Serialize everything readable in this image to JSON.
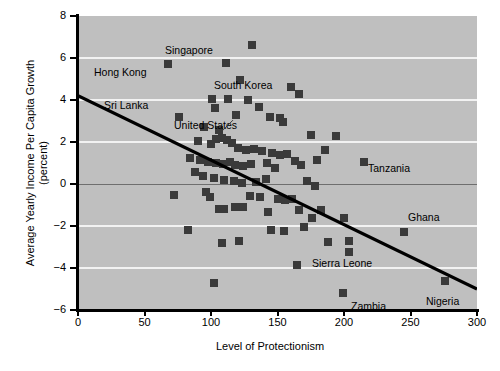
{
  "chart_data": {
    "type": "scatter",
    "title": "",
    "xlabel": "Level of Protectionism",
    "ylabel": "Average Yearly Income Per Capita Growth (percent)",
    "xlim": [
      0,
      300
    ],
    "ylim": [
      -6,
      8
    ],
    "xticks": [
      0,
      50,
      100,
      150,
      200,
      250,
      300
    ],
    "yticks": [
      -6,
      -4,
      -2,
      0,
      2,
      4,
      6,
      8
    ],
    "gridlines": {
      "y": [
        6,
        4,
        2,
        -2,
        -4
      ],
      "zero_line": 0,
      "x": []
    },
    "legend": "none",
    "plot_background": "#bfbfbf",
    "marker_color": "#3a3a3a",
    "trendline": {
      "x": [
        0,
        300
      ],
      "y": [
        4.2,
        -5.0
      ],
      "color": "#000000"
    },
    "points": [
      {
        "x": 68,
        "y": 5.7,
        "label": "Hong Kong",
        "label_side": "left"
      },
      {
        "x": 111,
        "y": 5.75,
        "label": "Singapore",
        "label_side": "above"
      },
      {
        "x": 131,
        "y": 6.6,
        "label": ""
      },
      {
        "x": 122,
        "y": 4.95,
        "label": "South Korea",
        "label_side": "right"
      },
      {
        "x": 76,
        "y": 3.2,
        "label": "Sri Lanka",
        "label_side": "left"
      },
      {
        "x": 101,
        "y": 4.05,
        "label": ""
      },
      {
        "x": 113,
        "y": 4.05,
        "label": ""
      },
      {
        "x": 103,
        "y": 3.6,
        "label": ""
      },
      {
        "x": 128,
        "y": 4.0,
        "label": ""
      },
      {
        "x": 136,
        "y": 3.65,
        "label": ""
      },
      {
        "x": 119,
        "y": 3.3,
        "label": ""
      },
      {
        "x": 144,
        "y": 3.2,
        "label": ""
      },
      {
        "x": 152,
        "y": 3.15,
        "label": ""
      },
      {
        "x": 160,
        "y": 4.6,
        "label": ""
      },
      {
        "x": 166,
        "y": 4.3,
        "label": ""
      },
      {
        "x": 154,
        "y": 2.95,
        "label": ""
      },
      {
        "x": 175,
        "y": 2.35,
        "label": ""
      },
      {
        "x": 95,
        "y": 2.7,
        "label": ""
      },
      {
        "x": 106,
        "y": 2.55,
        "label": ""
      },
      {
        "x": 90,
        "y": 2.05,
        "label": ""
      },
      {
        "x": 100,
        "y": 1.9,
        "label": "United States",
        "label_side": "leader"
      },
      {
        "x": 104,
        "y": 2.15,
        "label": ""
      },
      {
        "x": 108,
        "y": 2.2,
        "label": ""
      },
      {
        "x": 112,
        "y": 2.1,
        "label": ""
      },
      {
        "x": 116,
        "y": 1.95,
        "label": ""
      },
      {
        "x": 120,
        "y": 1.7,
        "label": ""
      },
      {
        "x": 126,
        "y": 1.6,
        "label": ""
      },
      {
        "x": 132,
        "y": 1.65,
        "label": ""
      },
      {
        "x": 138,
        "y": 1.55,
        "label": ""
      },
      {
        "x": 146,
        "y": 1.5,
        "label": ""
      },
      {
        "x": 152,
        "y": 1.4,
        "label": ""
      },
      {
        "x": 157,
        "y": 1.45,
        "label": ""
      },
      {
        "x": 84,
        "y": 1.25,
        "label": ""
      },
      {
        "x": 92,
        "y": 1.15,
        "label": ""
      },
      {
        "x": 98,
        "y": 1.05,
        "label": ""
      },
      {
        "x": 104,
        "y": 1.0,
        "label": ""
      },
      {
        "x": 109,
        "y": 0.95,
        "label": ""
      },
      {
        "x": 114,
        "y": 1.05,
        "label": ""
      },
      {
        "x": 118,
        "y": 0.9,
        "label": ""
      },
      {
        "x": 124,
        "y": 0.85,
        "label": ""
      },
      {
        "x": 130,
        "y": 0.95,
        "label": ""
      },
      {
        "x": 142,
        "y": 1.0,
        "label": ""
      },
      {
        "x": 148,
        "y": 0.75,
        "label": ""
      },
      {
        "x": 163,
        "y": 1.1,
        "label": ""
      },
      {
        "x": 168,
        "y": 0.9,
        "label": ""
      },
      {
        "x": 180,
        "y": 1.15,
        "label": ""
      },
      {
        "x": 194,
        "y": 2.3,
        "label": ""
      },
      {
        "x": 186,
        "y": 1.6,
        "label": ""
      },
      {
        "x": 215,
        "y": 1.05,
        "label": "Tanzania",
        "label_side": "right"
      },
      {
        "x": 88,
        "y": 0.55,
        "label": ""
      },
      {
        "x": 94,
        "y": 0.4,
        "label": ""
      },
      {
        "x": 102,
        "y": 0.3,
        "label": ""
      },
      {
        "x": 110,
        "y": 0.2,
        "label": ""
      },
      {
        "x": 117,
        "y": 0.15,
        "label": ""
      },
      {
        "x": 123,
        "y": 0.05,
        "label": ""
      },
      {
        "x": 134,
        "y": 0.1,
        "label": ""
      },
      {
        "x": 141,
        "y": 0.25,
        "label": ""
      },
      {
        "x": 172,
        "y": 0.15,
        "label": ""
      },
      {
        "x": 178,
        "y": -0.1,
        "label": ""
      },
      {
        "x": 72,
        "y": -0.5,
        "label": ""
      },
      {
        "x": 96,
        "y": -0.4,
        "label": ""
      },
      {
        "x": 99,
        "y": -0.6,
        "label": ""
      },
      {
        "x": 106,
        "y": -1.2,
        "label": ""
      },
      {
        "x": 110,
        "y": -1.2,
        "label": ""
      },
      {
        "x": 118,
        "y": -1.1,
        "label": ""
      },
      {
        "x": 124,
        "y": -1.1,
        "label": ""
      },
      {
        "x": 129,
        "y": -0.55,
        "label": ""
      },
      {
        "x": 137,
        "y": -0.6,
        "label": ""
      },
      {
        "x": 143,
        "y": -1.35,
        "label": ""
      },
      {
        "x": 150,
        "y": -0.7,
        "label": ""
      },
      {
        "x": 156,
        "y": -0.75,
        "label": ""
      },
      {
        "x": 161,
        "y": -0.7,
        "label": ""
      },
      {
        "x": 166,
        "y": -1.25,
        "label": ""
      },
      {
        "x": 176,
        "y": -1.6,
        "label": ""
      },
      {
        "x": 83,
        "y": -2.2,
        "label": ""
      },
      {
        "x": 108,
        "y": -2.8,
        "label": ""
      },
      {
        "x": 121,
        "y": -2.7,
        "label": ""
      },
      {
        "x": 145,
        "y": -2.2,
        "label": ""
      },
      {
        "x": 155,
        "y": -2.25,
        "label": ""
      },
      {
        "x": 170,
        "y": -2.05,
        "label": ""
      },
      {
        "x": 183,
        "y": -1.25,
        "label": ""
      },
      {
        "x": 200,
        "y": -1.6,
        "label": ""
      },
      {
        "x": 188,
        "y": -2.75,
        "label": ""
      },
      {
        "x": 204,
        "y": -2.7,
        "label": ""
      },
      {
        "x": 204,
        "y": -3.25,
        "label": "Sierra Leone",
        "label_side": "below"
      },
      {
        "x": 245,
        "y": -2.3,
        "label": "Ghana",
        "label_side": "right"
      },
      {
        "x": 102,
        "y": -4.7,
        "label": ""
      },
      {
        "x": 165,
        "y": -3.85,
        "label": ""
      },
      {
        "x": 199,
        "y": -5.2,
        "label": "Zambia",
        "label_side": "right"
      },
      {
        "x": 276,
        "y": -4.6,
        "label": "Nigeria",
        "label_side": "below"
      }
    ],
    "annotations": [
      {
        "text": "Hong Kong",
        "x_px": 94,
        "y_px": 67
      },
      {
        "text": "Singapore",
        "x_px": 165,
        "y_px": 45
      },
      {
        "text": "South Korea",
        "x_px": 214,
        "y_px": 80
      },
      {
        "text": "Sri Lanka",
        "x_px": 104,
        "y_px": 100
      },
      {
        "text": "United States",
        "x_px": 174,
        "y_px": 120
      },
      {
        "text": "Tanzania",
        "x_px": 368,
        "y_px": 163
      },
      {
        "text": "Ghana",
        "x_px": 408,
        "y_px": 212
      },
      {
        "text": "Sierra Leone",
        "x_px": 312,
        "y_px": 258
      },
      {
        "text": "Zambia",
        "x_px": 351,
        "y_px": 301
      },
      {
        "text": "Nigeria",
        "x_px": 426,
        "y_px": 296
      }
    ]
  }
}
